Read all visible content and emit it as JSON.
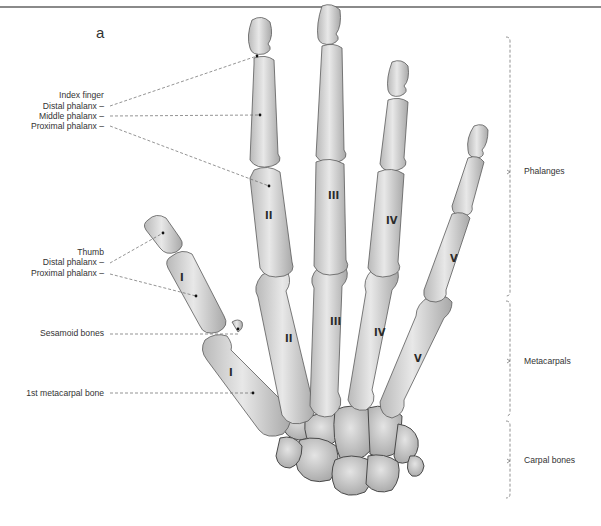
{
  "figure": {
    "letter": "a",
    "colors": {
      "bone_light": "#e6e6e6",
      "bone_mid": "#c7c7c7",
      "bone_dark": "#9a9a9a",
      "line": "#666666",
      "rule": "#8a8a8a"
    }
  },
  "left_labels": {
    "index_finger": {
      "heading": "Index finger",
      "distal": "Distal phalanx –",
      "middle": "Middle phalanx –",
      "proximal": "Proximal phalanx –"
    },
    "thumb": {
      "heading": "Thumb",
      "distal": "Distal phalanx –",
      "proximal": "Proximal phalanx –"
    },
    "sesamoid": "Sesamoid bones",
    "first_metacarpal": "1st metacarpal bone"
  },
  "right_labels": {
    "phalanges": "Phalanges",
    "metacarpals": "Metacarpals",
    "carpal_bones": "Carpal bones"
  },
  "numerals": {
    "phalanges": [
      "I",
      "II",
      "III",
      "IV",
      "V"
    ],
    "metacarpals": [
      "I",
      "II",
      "III",
      "IV",
      "V"
    ]
  }
}
